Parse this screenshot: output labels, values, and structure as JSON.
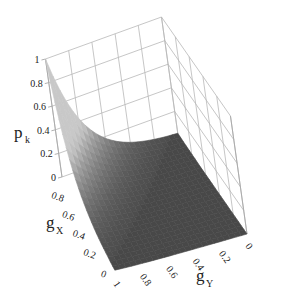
{
  "chart_data": {
    "type": "surface3d",
    "title": "",
    "zlabel": "p_k",
    "xlabel": "g_X",
    "ylabel": "g_Y",
    "z_ticks": [
      "0",
      "0.2",
      "0.4",
      "0.6",
      "0.8",
      "1"
    ],
    "x_ticks": [
      "0",
      "0.2",
      "0.4",
      "0.6",
      "0.8",
      "1"
    ],
    "y_ticks": [
      "1",
      "0.8",
      "0.6",
      "0.4",
      "0.2",
      "0"
    ],
    "zlim": [
      0,
      1
    ],
    "xlim": [
      0,
      1
    ],
    "ylim": [
      0,
      1
    ],
    "grid": true,
    "surface_description": "p_k is 1 at g_X=1, g_Y=0 corner and decays rapidly toward 0; flat near 0 over most of the domain",
    "sample_points": [
      {
        "g_X": 1.0,
        "g_Y": 0.0,
        "p_k": 1.0
      },
      {
        "g_X": 1.0,
        "g_Y": 0.2,
        "p_k": 0.45
      },
      {
        "g_X": 1.0,
        "g_Y": 0.4,
        "p_k": 0.2
      },
      {
        "g_X": 1.0,
        "g_Y": 0.6,
        "p_k": 0.08
      },
      {
        "g_X": 1.0,
        "g_Y": 1.0,
        "p_k": 0.0
      },
      {
        "g_X": 0.8,
        "g_Y": 0.0,
        "p_k": 0.45
      },
      {
        "g_X": 0.6,
        "g_Y": 0.0,
        "p_k": 0.2
      },
      {
        "g_X": 0.4,
        "g_Y": 0.0,
        "p_k": 0.08
      },
      {
        "g_X": 0.0,
        "g_Y": 0.0,
        "p_k": 0.0
      },
      {
        "g_X": 0.0,
        "g_Y": 1.0,
        "p_k": 0.0
      }
    ]
  },
  "labels": {
    "z_main": "p",
    "z_sub": "k",
    "x_main": "g",
    "x_sub": "X",
    "y_main": "g",
    "y_sub": "Y"
  }
}
